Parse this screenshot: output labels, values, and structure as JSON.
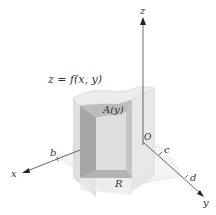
{
  "figure": {
    "labels": {
      "surface": "z = f(x, y)",
      "cross_section": "A(y)",
      "region": "R",
      "origin": "O",
      "x_axis": "x",
      "y_axis": "y",
      "z_axis": "z",
      "b": "b",
      "c": "c",
      "d": "d"
    },
    "colors": {
      "axis": "#444444",
      "solid_light": "#e6e6e6",
      "solid_mid": "#cfcfcf",
      "solid_dark": "#a9a9a9",
      "text": "#333333"
    }
  }
}
